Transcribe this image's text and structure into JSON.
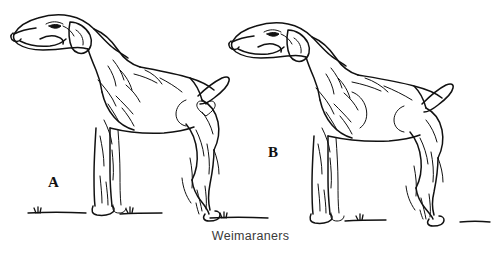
{
  "figure": {
    "caption": "Weimaraners",
    "background_color": "#ffffff",
    "ink_color": "#000000",
    "caption_color": "#3a3a3a",
    "labels": [
      {
        "id": "A",
        "text": "A",
        "describes": "left dog standing in profile facing left"
      },
      {
        "id": "B",
        "text": "B",
        "describes": "right dog standing in profile facing left"
      }
    ],
    "style": "black and white pen-and-ink line art with hatched shading",
    "dogs": [
      {
        "name": "dog-a",
        "label": "A",
        "orientation": "profile facing left",
        "tail": "docked, carried up and back",
        "ears": "long, folded, hanging",
        "ground": "short ground line with grass tufts"
      },
      {
        "name": "dog-b",
        "label": "B",
        "orientation": "profile facing left",
        "tail": "docked, carried up and back",
        "ears": "long, folded, hanging",
        "ground": "short ground line with grass tufts"
      }
    ]
  }
}
